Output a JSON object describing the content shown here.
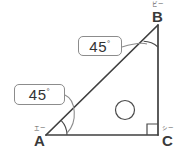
{
  "figure": {
    "type": "right-triangle-geometry-diagram",
    "background_color": "#ffffff",
    "line_color": "#3f3f3f",
    "box_border_color": "#8c8c8c"
  },
  "vertices": {
    "a": {
      "label": "A",
      "furigana": "エー",
      "x": 46,
      "y": 135
    },
    "b": {
      "label": "B",
      "furigana": "ビー",
      "x": 158,
      "y": 25
    },
    "c": {
      "label": "C",
      "furigana": "シー",
      "x": 158,
      "y": 135
    }
  },
  "angles": {
    "a": {
      "value": "45",
      "degree_symbol": "°",
      "marked": true
    },
    "b": {
      "value": "45",
      "degree_symbol": "°",
      "marked": true
    },
    "c": {
      "value": "90",
      "degree_symbol": "°",
      "marked": true,
      "marker": "right-angle-square"
    }
  },
  "callouts": [
    {
      "id": "angle-b-callout",
      "value": "45",
      "degree_symbol": "°",
      "points_to": "B"
    },
    {
      "id": "angle-a-callout",
      "value": "45",
      "degree_symbol": "°",
      "points_to": "A"
    }
  ],
  "annotation_circle": {
    "label": "",
    "description": "blank-circle"
  }
}
